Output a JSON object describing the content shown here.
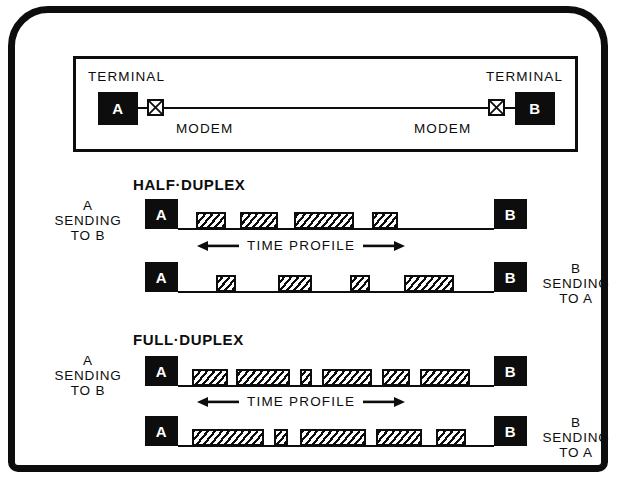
{
  "figure": {
    "link_panel": {
      "left_terminal_caption": "TERMINAL",
      "right_terminal_caption": "TERMINAL",
      "left_terminal_label": "A",
      "right_terminal_label": "B",
      "left_modem_caption": "MODEM",
      "right_modem_caption": "MODEM",
      "modem_icon": "crossed-box-modem-icon"
    },
    "sections": [
      {
        "key": "half_duplex",
        "title": "HALF·DUPLEX",
        "left_label": "A\nSENDING\nTO B",
        "left_label_lines": [
          "A",
          "SENDING",
          "TO B"
        ],
        "right_label_lines": [
          "B",
          "SENDING",
          "TO A"
        ],
        "time_profile_label": "TIME PROFILE",
        "rows": [
          {
            "key": "a-to-b",
            "start_label": "A",
            "end_label": "B",
            "pulses": [
              {
                "x": 18,
                "w": 30
              },
              {
                "x": 62,
                "w": 38
              },
              {
                "x": 116,
                "w": 60
              },
              {
                "x": 194,
                "w": 26
              }
            ]
          },
          {
            "key": "b-to-a",
            "start_label": "A",
            "end_label": "B",
            "pulses": [
              {
                "x": 38,
                "w": 20
              },
              {
                "x": 100,
                "w": 34
              },
              {
                "x": 172,
                "w": 20
              },
              {
                "x": 226,
                "w": 50
              }
            ]
          }
        ]
      },
      {
        "key": "full_duplex",
        "title": "FULL·DUPLEX",
        "left_label_lines": [
          "A",
          "SENDING",
          "TO B"
        ],
        "right_label_lines": [
          "B",
          "SENDING",
          "TO A"
        ],
        "time_profile_label": "TIME PROFILE",
        "rows": [
          {
            "key": "a-to-b",
            "start_label": "A",
            "end_label": "B",
            "pulses": [
              {
                "x": 14,
                "w": 36
              },
              {
                "x": 58,
                "w": 54
              },
              {
                "x": 122,
                "w": 12
              },
              {
                "x": 144,
                "w": 50
              },
              {
                "x": 204,
                "w": 28
              },
              {
                "x": 242,
                "w": 50
              }
            ]
          },
          {
            "key": "b-to-a",
            "start_label": "A",
            "end_label": "B",
            "pulses": [
              {
                "x": 14,
                "w": 72
              },
              {
                "x": 96,
                "w": 14
              },
              {
                "x": 122,
                "w": 66
              },
              {
                "x": 198,
                "w": 46
              },
              {
                "x": 258,
                "w": 30
              }
            ]
          }
        ]
      }
    ]
  },
  "colors": {
    "ink": "#0d0d0d",
    "paper": "#ffffff"
  }
}
